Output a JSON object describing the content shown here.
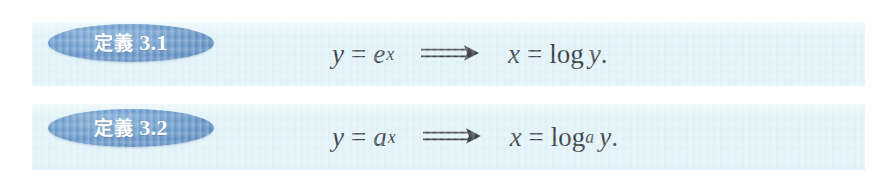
{
  "page": {
    "background_color": "#ffffff",
    "band_color": "#ddf1f8",
    "badge_color": "#5b8fc4",
    "text_color": "#2a2f38"
  },
  "definitions": [
    {
      "badge_word": "定義",
      "badge_number": "3.1",
      "badge_full": "定義 3.1",
      "formula_plain": "y = e^x  ⟹  x = log y.",
      "lhs": {
        "base_variable": "y",
        "relation": "=",
        "exponent_base": "e",
        "exponent": "x"
      },
      "arrow": "⟹",
      "rhs": {
        "variable": "x",
        "relation": "=",
        "operator": "log",
        "operator_subscript": "",
        "argument": "y",
        "terminator": "."
      }
    },
    {
      "badge_word": "定義",
      "badge_number": "3.2",
      "badge_full": "定義 3.2",
      "formula_plain": "y = a^x  ⟹  x = log_a y.",
      "lhs": {
        "base_variable": "y",
        "relation": "=",
        "exponent_base": "a",
        "exponent": "x"
      },
      "arrow": "⟹",
      "rhs": {
        "variable": "x",
        "relation": "=",
        "operator": "log",
        "operator_subscript": "a",
        "argument": "y",
        "terminator": "."
      }
    }
  ]
}
